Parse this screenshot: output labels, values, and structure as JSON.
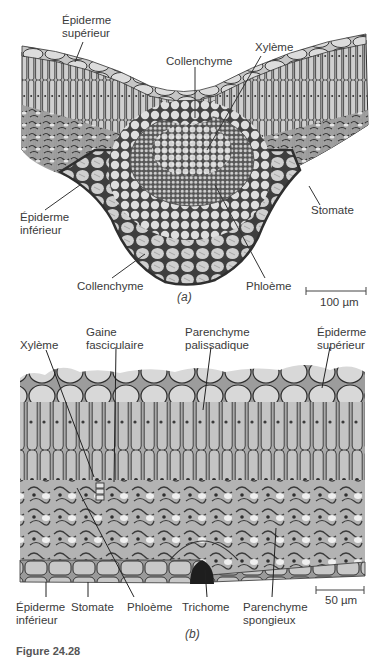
{
  "figure": {
    "caption_partial": "Figure 24.28",
    "panel_a": {
      "id_label": "(a)",
      "scale_bar": "100 µm",
      "labels": {
        "epiderme_superieur": [
          "Épiderme",
          "supérieur"
        ],
        "collenchyme_top": "Collenchyme",
        "xyleme": "Xylème",
        "stomate": "Stomate",
        "epiderme_inferieur": [
          "Épiderme",
          "inférieur"
        ],
        "collenchyme_bottom": "Collenchyme",
        "phloeme": "Phloème"
      }
    },
    "panel_b": {
      "id_label": "(b)",
      "scale_bar": "50 µm",
      "labels": {
        "xyleme": "Xylème",
        "gaine_fasciculaire": [
          "Gaine",
          "fasciculaire"
        ],
        "parenchyme_palissadique": [
          "Parenchyme",
          "palissadique"
        ],
        "epiderme_superieur": [
          "Épiderme",
          "supérieur"
        ],
        "epiderme_inferieur": [
          "Épiderme",
          "inférieur"
        ],
        "stomate": "Stomate",
        "phloeme": "Phloème",
        "trichome": "Trichome",
        "parenchyme_spongieux": [
          "Parenchyme",
          "spongieux"
        ]
      }
    },
    "colors": {
      "tissue_light": "#d9d9d9",
      "tissue_mid": "#a8a8a8",
      "tissue_dark": "#4a4a4a",
      "label_text": "#3a3a3a",
      "leader_line": "#333333"
    }
  }
}
